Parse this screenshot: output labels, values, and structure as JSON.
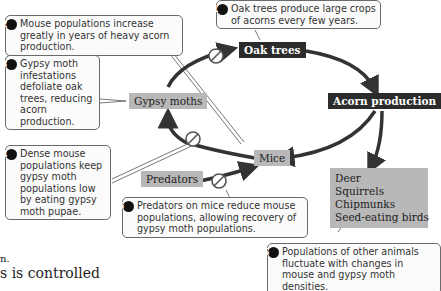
{
  "diagram": {
    "nodes": {
      "oak_trees": "Oak trees",
      "acorn_production": "Acorn production",
      "mice": "Mice",
      "gypsy_moths": "Gypsy moths",
      "predators": "Predators",
      "other_animals": [
        "Deer",
        "Squirrels",
        "Chipmunks",
        "Seed-eating birds"
      ]
    },
    "callouts": [
      {
        "number": "1",
        "text": "Oak trees produce large crops of acorns every few years."
      },
      {
        "number": "2",
        "text": "Mouse populations increase greatly in years of heavy acorn production."
      },
      {
        "number": "3",
        "text": "Gypsy moth infestations defoliate oak trees, reducing acorn production."
      },
      {
        "number": "4",
        "text": "Dense mouse populations keep gypsy moth populations low by eating gypsy moth pupae."
      },
      {
        "number": "5",
        "text": "Predators on mice reduce mouse populations, allowing recovery of gypsy moth populations."
      },
      {
        "number": "6",
        "text": "Populations of other animals fluctuate with changes in mouse and gypsy moth densities."
      }
    ],
    "edges": [
      {
        "from": "Oak trees",
        "to": "Acorn production",
        "type": "positive"
      },
      {
        "from": "Acorn production",
        "to": "Mice",
        "type": "positive"
      },
      {
        "from": "Acorn production",
        "to": "Deer/Squirrels/Chipmunks/Seed-eating birds",
        "type": "positive"
      },
      {
        "from": "Mice",
        "to": "Gypsy moths",
        "type": "inhibitory"
      },
      {
        "from": "Gypsy moths",
        "to": "Oak trees",
        "type": "inhibitory"
      },
      {
        "from": "Predators",
        "to": "Mice",
        "type": "inhibitory"
      }
    ],
    "icons": {
      "inhibit": "no-sign-icon",
      "arrow": "arrowhead-icon"
    },
    "colors": {
      "dark_node": "#2b2b2b",
      "gray_node": "#b8b8b8",
      "arrow": "#333333"
    }
  },
  "background_text": {
    "line1": "n.",
    "line2": "s is controlled"
  }
}
